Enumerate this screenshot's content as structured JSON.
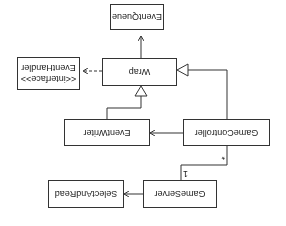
{
  "diagram": {
    "type": "uml-class-diagram",
    "orientation": "rotated-180",
    "classes": {
      "event_queue": {
        "name": "EventQueue"
      },
      "event_handler": {
        "stereotype": "<<interface>>",
        "name": "EventHandler"
      },
      "wrap": {
        "name": "Wrap"
      },
      "event_writer": {
        "name": "EventWriter"
      },
      "game_controller": {
        "name": "GameController"
      },
      "game_server": {
        "name": "GameServer"
      },
      "select_and_read": {
        "name": "SelectAndRead"
      }
    },
    "relations": [
      {
        "from": "Wrap",
        "to": "EventQueue",
        "kind": "association"
      },
      {
        "from": "Wrap",
        "to": "EventHandler",
        "kind": "realization"
      },
      {
        "from": "EventWriter",
        "to": "Wrap",
        "kind": "generalization"
      },
      {
        "from": "GameController",
        "to": "Wrap",
        "kind": "generalization"
      },
      {
        "from": "GameController",
        "to": "EventWriter",
        "kind": "association"
      },
      {
        "from": "GameServer",
        "to": "GameController",
        "kind": "association",
        "multiplicity_server": "1",
        "multiplicity_controller": "*"
      },
      {
        "from": "GameServer",
        "to": "SelectAndRead",
        "kind": "association"
      }
    ],
    "multiplicities": {
      "many": "*",
      "one": "1"
    },
    "colors": {
      "line": "#333333",
      "background": "#ffffff",
      "text": "#222222"
    }
  }
}
